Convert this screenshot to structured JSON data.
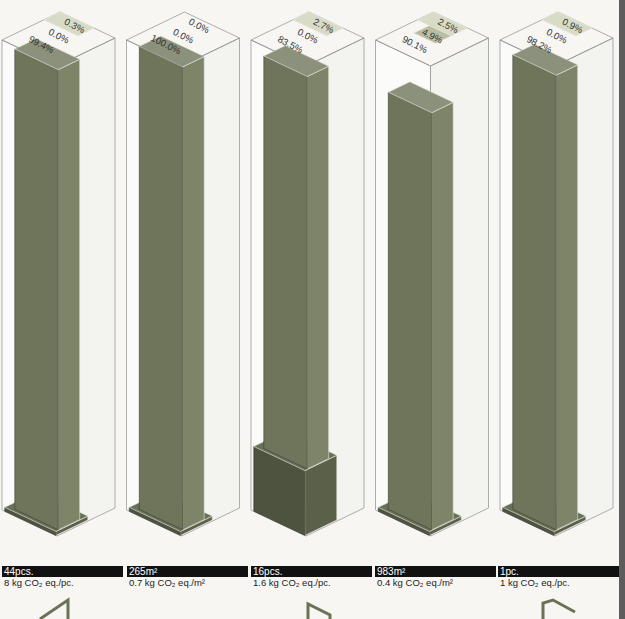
{
  "colors": {
    "dark": "#5b6048",
    "mid": "#7e8468",
    "light": "#d8dcc6",
    "outline": "#8e8e8e"
  },
  "chart_data": {
    "type": "bar",
    "subtype": "isometric-stacked-column",
    "title": "",
    "columns": [
      {
        "quantity": "44pcs.",
        "factor": "8 kg CO₂ eq./pc.",
        "segments": [
          {
            "name": "base",
            "value": 0.3,
            "label": "0.3%"
          },
          {
            "name": "main",
            "value": 99.4,
            "label": "99.4%"
          },
          {
            "name": "mid",
            "value": 0.0,
            "label": "0.0%"
          },
          {
            "name": "top",
            "value": 0.3,
            "label": "0.3%"
          }
        ]
      },
      {
        "quantity": "265m²",
        "factor": "0.7 kg CO₂ eq./m²",
        "segments": [
          {
            "name": "base",
            "value": 0.0,
            "label": "0.0%"
          },
          {
            "name": "main",
            "value": 100.0,
            "label": "100.0%"
          },
          {
            "name": "mid",
            "value": 0.0,
            "label": "0.0%"
          },
          {
            "name": "top",
            "value": 0.0,
            "label": "0.0%"
          }
        ]
      },
      {
        "quantity": "16pcs.",
        "factor": "1.6 kg CO₂ eq./pc.",
        "segments": [
          {
            "name": "base",
            "value": 13.8,
            "label": "13.8%"
          },
          {
            "name": "main",
            "value": 83.5,
            "label": "83.5%"
          },
          {
            "name": "mid",
            "value": 0.0,
            "label": "0.0%"
          },
          {
            "name": "top",
            "value": 2.7,
            "label": "2.7%"
          }
        ]
      },
      {
        "quantity": "983m²",
        "factor": "0.4 kg CO₂ eq./m²",
        "segments": [
          {
            "name": "base",
            "value": 2.5,
            "label": "2.5%"
          },
          {
            "name": "main",
            "value": 90.1,
            "label": "90.1%"
          },
          {
            "name": "mid",
            "value": 4.9,
            "label": "4.9%"
          },
          {
            "name": "top",
            "value": 2.5,
            "label": "2.5%"
          }
        ]
      },
      {
        "quantity": "1pc.",
        "factor": "1 kg CO₂ eq./pc.",
        "segments": [
          {
            "name": "base",
            "value": 0.9,
            "label": "0.9%"
          },
          {
            "name": "main",
            "value": 98.2,
            "label": "98.2%"
          },
          {
            "name": "mid",
            "value": 0.0,
            "label": "0.0%"
          },
          {
            "name": "top",
            "value": 0.9,
            "label": "0.9%"
          }
        ]
      }
    ],
    "ylim": [
      0,
      100
    ],
    "unit": "%"
  }
}
